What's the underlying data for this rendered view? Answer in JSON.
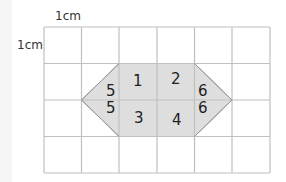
{
  "labels": {
    "horizontal_unit": "1cm",
    "vertical_unit": "1cm"
  },
  "grid": {
    "columns": 6,
    "rows": 4,
    "line_color": "#c0c0c0"
  },
  "shape": {
    "name": "hexagon",
    "fill": "#dedede",
    "stroke": "#999999",
    "pieces": [
      "1",
      "2",
      "3",
      "4",
      "5",
      "5",
      "6",
      "6"
    ]
  }
}
